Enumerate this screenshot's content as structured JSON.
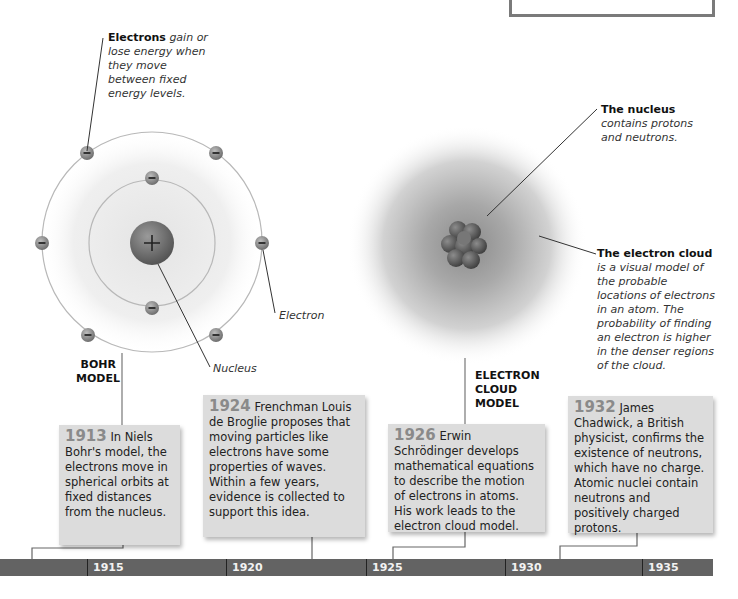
{
  "callouts": {
    "electrons_energy": {
      "bold": "Electrons",
      "italic": " gain or lose energy when they move between fixed energy levels."
    },
    "nucleus_cloud": {
      "bold": "The nucleus",
      "italic": " contains protons and neutrons."
    },
    "electron_cloud": {
      "bold": "The electron cloud",
      "italic": " is a visual model of the probable locations of electrons in an atom. The probability of finding an electron is higher in the denser regions of the cloud."
    },
    "electron_label": "Electron",
    "nucleus_label": "Nucleus"
  },
  "models": {
    "bohr": {
      "line1": "BOHR",
      "line2": "MODEL"
    },
    "cloud": {
      "line1": "ELECTRON",
      "line2": "CLOUD",
      "line3": "MODEL"
    }
  },
  "cards": [
    {
      "year": "1913",
      "text": " In Niels Bohr's model, the electrons move in spherical orbits at fixed distances from the nucleus."
    },
    {
      "year": "1924",
      "text": " Frenchman Louis de Broglie proposes that moving particles like electrons have some properties of waves. Within a few years, evidence is collected to support this idea."
    },
    {
      "year": "1926",
      "text": " Erwin Schrödinger develops mathematical equations to describe the motion of electrons in atoms. His work leads to the electron cloud model."
    },
    {
      "year": "1932",
      "text": " James Chadwick, a British physicist, confirms the existence of neutrons, which have no charge. Atomic nuclei contain neutrons and positively charged protons."
    }
  ],
  "timeline": {
    "ticks": [
      "1915",
      "1920",
      "1925",
      "1930",
      "1935"
    ]
  },
  "colors": {
    "timeline_bar": "#636363",
    "card_bg": "#dcdcdc",
    "year_text": "#8a8a8a",
    "nucleus": "#6b6b6b"
  }
}
